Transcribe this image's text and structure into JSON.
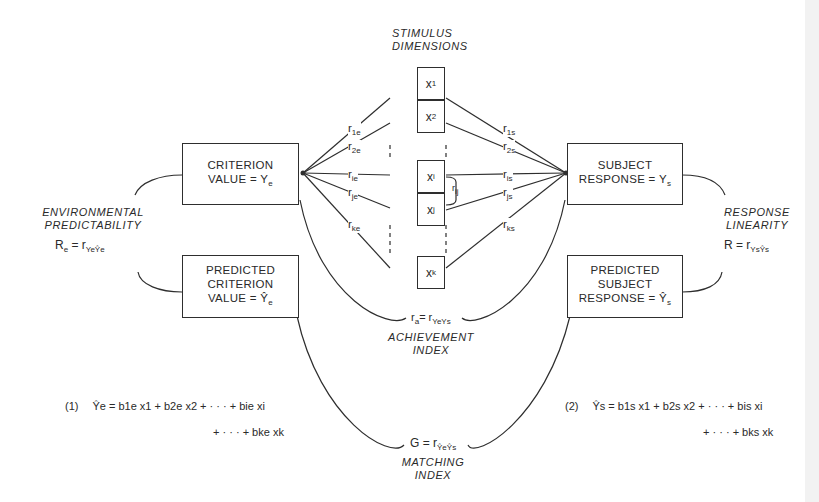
{
  "stimulus_header": [
    "STIMULUS",
    "DIMENSIONS"
  ],
  "stimulus_boxes": [
    {
      "name": "x",
      "sub": "1"
    },
    {
      "name": "x",
      "sub": "2"
    },
    {
      "name": "x",
      "sub": "i"
    },
    {
      "name": "x",
      "sub": "j"
    },
    {
      "name": "x",
      "sub": "k"
    }
  ],
  "inter_cue_label": {
    "r": "r",
    "sub": "ij"
  },
  "left_weights": [
    {
      "r": "r",
      "sub": "1e"
    },
    {
      "r": "r",
      "sub": "2e"
    },
    {
      "r": "r",
      "sub": "ie"
    },
    {
      "r": "r",
      "sub": "je"
    },
    {
      "r": "r",
      "sub": "ke"
    }
  ],
  "right_weights": [
    {
      "r": "r",
      "sub": "1s"
    },
    {
      "r": "r",
      "sub": "2s"
    },
    {
      "r": "r",
      "sub": "is"
    },
    {
      "r": "r",
      "sub": "js"
    },
    {
      "r": "r",
      "sub": "ks"
    }
  ],
  "boxes": {
    "criterion": {
      "line1": "CRITERION",
      "line2": "VALUE = Y",
      "sub": "e"
    },
    "predicted_criterion": {
      "line1": "PREDICTED",
      "line2": "CRITERION",
      "line3": "VALUE = Ŷ",
      "sub": "e"
    },
    "subject_response": {
      "line1": "SUBJECT",
      "line2": "RESPONSE = Y",
      "sub": "s"
    },
    "predicted_subject": {
      "line1": "PREDICTED",
      "line2": "SUBJECT",
      "line3": "RESPONSE = Ŷ",
      "sub": "s"
    }
  },
  "environmental_predictability": {
    "line1": "ENVIRONMENTAL",
    "line2": "PREDICTABILITY",
    "formula_lhs": "R",
    "formula_lhs_sub": "e",
    "formula_rhs": "= r",
    "formula_rhs_sub": "YeŶe"
  },
  "response_linearity": {
    "line1": "RESPONSE",
    "line2": "LINEARITY",
    "formula_lhs": "R",
    "formula_rhs": "= r",
    "formula_rhs_sub": "YsŶs"
  },
  "achievement": {
    "formula_lhs": "r",
    "formula_lhs_sub": "a",
    "formula_rhs": "= r",
    "formula_rhs_sub": "YeYs",
    "line1": "ACHIEVEMENT",
    "line2": "INDEX"
  },
  "matching": {
    "formula_lhs": "G",
    "formula_rhs": "= r",
    "formula_rhs_sub": "ŶeŶs",
    "line1": "MATCHING",
    "line2": "INDEX"
  },
  "equation1": {
    "number": "(1)",
    "line1": "Ŷe = b1e x1 + b2e x2 + · · · + bie xi",
    "line2": "+ · · · + bke xk"
  },
  "equation2": {
    "number": "(2)",
    "line1": "Ŷs = b1s x1 + b2s x2 + · · · + bis xi",
    "line2": "+ · · · + bks xk"
  }
}
